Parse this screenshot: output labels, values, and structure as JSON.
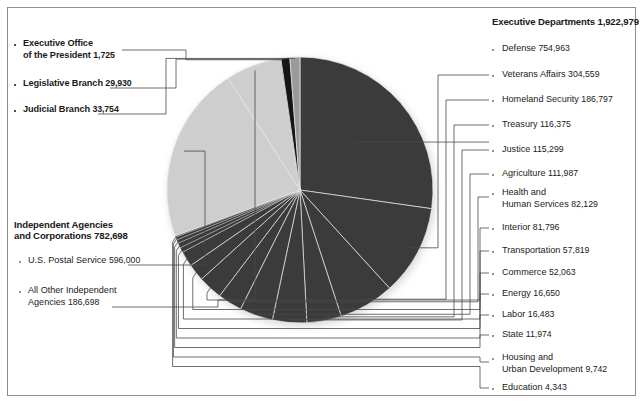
{
  "figure": {
    "title_right": "Executive Departments",
    "title_right_value": "1,922,979",
    "title_left": "Independent Agencies\nand Corporations",
    "title_left_line1": "Independent Agencies",
    "title_left_line2": "and Corporations",
    "title_left_value": "782,698"
  },
  "left_top": [
    {
      "name_line1": "Executive Office",
      "name_line2": "of the President",
      "value": "1,725"
    },
    {
      "name_line1": "Legislative Branch",
      "name_line2": "",
      "value": "29,930"
    },
    {
      "name_line1": "Judicial Branch",
      "name_line2": "",
      "value": "33,754"
    }
  ],
  "left_bottom": [
    {
      "name_line1": "U.S. Postal Service",
      "name_line2": "",
      "value": "596,000"
    },
    {
      "name_line1": "All Other Independent",
      "name_line2": "Agencies",
      "value": "186,698"
    }
  ],
  "right_items": [
    {
      "name_line1": "Defense",
      "name_line2": "",
      "value": "754,963"
    },
    {
      "name_line1": "Veterans Affairs",
      "name_line2": "",
      "value": "304,559"
    },
    {
      "name_line1": "Homeland Security",
      "name_line2": "",
      "value": "186,797"
    },
    {
      "name_line1": "Treasury",
      "name_line2": "",
      "value": "116,375"
    },
    {
      "name_line1": "Justice",
      "name_line2": "",
      "value": "115,299"
    },
    {
      "name_line1": "Agriculture",
      "name_line2": "",
      "value": "111,987"
    },
    {
      "name_line1": "Health and",
      "name_line2": "Human Services",
      "value": "82,129"
    },
    {
      "name_line1": "Interior",
      "name_line2": "",
      "value": "81,796"
    },
    {
      "name_line1": "Transportation",
      "name_line2": "",
      "value": "57,819"
    },
    {
      "name_line1": "Commerce",
      "name_line2": "",
      "value": "52,063"
    },
    {
      "name_line1": "Energy",
      "name_line2": "",
      "value": "16,650"
    },
    {
      "name_line1": "Labor",
      "name_line2": "",
      "value": "16,483"
    },
    {
      "name_line1": "State",
      "name_line2": "",
      "value": "11,974"
    },
    {
      "name_line1": "Housing and",
      "name_line2": "Urban Development",
      "value": "9,742"
    },
    {
      "name_line1": "Education",
      "name_line2": "",
      "value": "4,343"
    }
  ],
  "colors": {
    "dark_slice": "#3b3b3b",
    "light_slice": "#cecece",
    "near_black": "#151515",
    "mid_gray": "#9a9a9a",
    "leader": "#4a4a4a",
    "frame": "#8d8d8d",
    "background": "#ffffff"
  },
  "chart_data": {
    "type": "pie",
    "xlabel": "",
    "ylabel": "",
    "labels": [
      "Defense",
      "Veterans Affairs",
      "Homeland Security",
      "Treasury",
      "Justice",
      "Agriculture",
      "Health and Human Services",
      "Interior",
      "Transportation",
      "Commerce",
      "Energy",
      "Labor",
      "State",
      "Housing and Urban Development",
      "Education",
      "U.S. Postal Service",
      "All Other Independent Agencies",
      "Executive Office of the President",
      "Legislative Branch",
      "Judicial Branch"
    ],
    "values": [
      754963,
      304559,
      186797,
      116375,
      115299,
      111987,
      82129,
      81796,
      57819,
      52063,
      16650,
      16483,
      11974,
      9742,
      4343,
      596000,
      186698,
      1725,
      29930,
      33754
    ],
    "groups": [
      {
        "name": "Executive Departments",
        "total": 1922979
      },
      {
        "name": "Independent Agencies and Corporations",
        "total": 782698
      },
      {
        "name": "Executive Office of the President",
        "total": 1725
      },
      {
        "name": "Legislative Branch",
        "total": 29930
      },
      {
        "name": "Judicial Branch",
        "total": 33754
      }
    ],
    "total": 2771086,
    "legend_position": "right-and-left",
    "grid": false
  }
}
